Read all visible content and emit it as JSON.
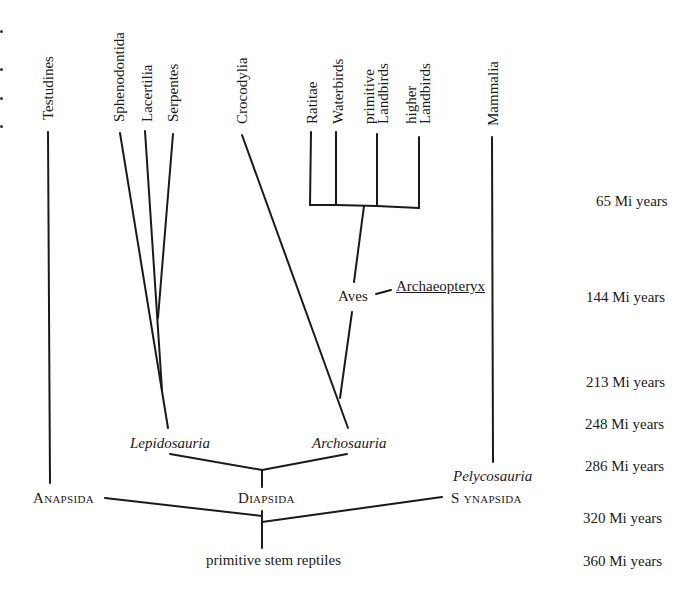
{
  "diagram": {
    "type": "phylogenetic-tree",
    "taxa_top": [
      {
        "id": "testudines",
        "label": "Testudines"
      },
      {
        "id": "sphenodontida",
        "label": "Sphenodontida"
      },
      {
        "id": "lacertilia",
        "label": "Lacertilia"
      },
      {
        "id": "serpentes",
        "label": "Serpentes"
      },
      {
        "id": "crocodylia",
        "label": "Crocodylia"
      },
      {
        "id": "ratitae",
        "label": "Ratitae"
      },
      {
        "id": "waterbirds",
        "label": "Waterbirds"
      },
      {
        "id": "primitive_landbirds",
        "line1": "primitive",
        "line2": "Landbirds"
      },
      {
        "id": "higher_landbirds",
        "line1": "higher",
        "line2": "Landbirds"
      },
      {
        "id": "mammalia",
        "label": "Mammalia"
      }
    ],
    "clades": {
      "aves": "Aves",
      "archaeopteryx": "Archaeopteryx",
      "lepidosauria": "Lepidosauria",
      "archosauria": "Archosauria",
      "pelycosauria": "Pelycosauria",
      "anapsida": "Anapsida",
      "diapsida": "Diapsida",
      "synapsida_s": "S",
      "synapsida_rest": "ynapsida",
      "root": "primitive stem reptiles"
    },
    "timescale": [
      {
        "label": "65 Mi years",
        "value": 65
      },
      {
        "label": "144 Mi years",
        "value": 144
      },
      {
        "label": "213 Mi years",
        "value": 213
      },
      {
        "label": "248 Mi years",
        "value": 248
      },
      {
        "label": "286 Mi years",
        "value": 286
      },
      {
        "label": "320 Mi years",
        "value": 320
      },
      {
        "label": "360 Mi years",
        "value": 360
      }
    ],
    "line_color": "#1a1a1a"
  }
}
